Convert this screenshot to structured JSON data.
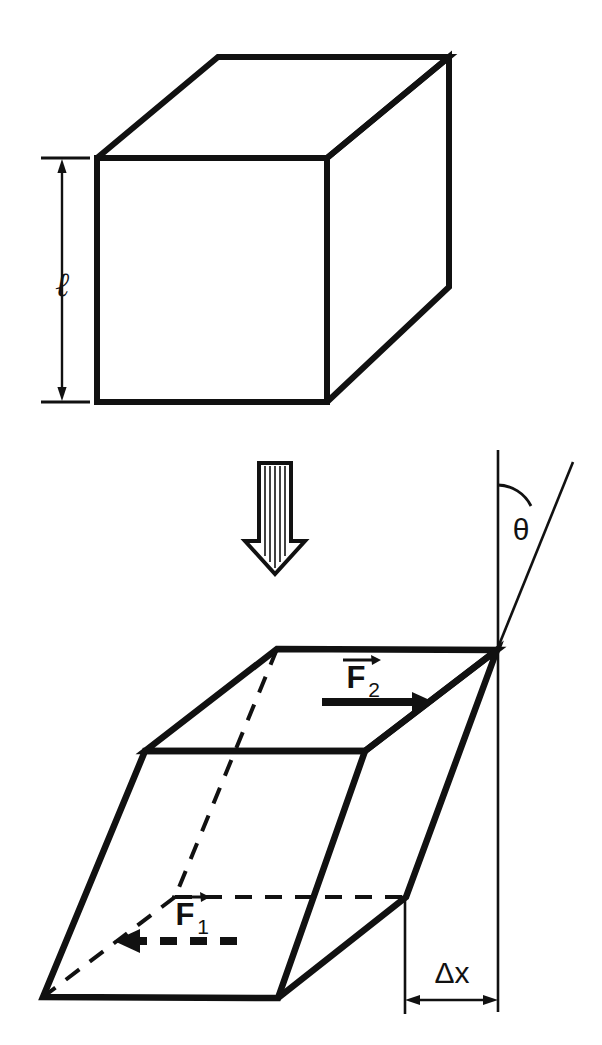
{
  "figure": {
    "background_color": "#ffffff",
    "stroke_color": "#111111",
    "width": 602,
    "height": 1045
  },
  "panels": [
    {
      "id": "undeformed",
      "name": "undeformed-cube",
      "caption": "Undeformed cube"
    },
    {
      "id": "deformed",
      "name": "sheared-cube",
      "caption": "Sheared cube"
    }
  ],
  "labels": {
    "length": "ℓ",
    "length_meaning": "side length of cube",
    "theta": "θ",
    "theta_meaning": "shear angle from vertical",
    "force_top": "F",
    "force_top_sub": "2",
    "force_bottom": "F",
    "force_bottom_sub": "1",
    "delta_x": "Δx",
    "delta_x_meaning": "shear displacement"
  },
  "icons": {
    "transform_arrow": "down-block-arrow-icon",
    "force_top_arrow": "right-solid-arrow-icon",
    "force_bottom_arrow": "left-dashed-arrow-icon",
    "length_dimension_arrow": "vertical-double-arrow-icon",
    "delta_x_dimension_arrow": "horizontal-double-arrow-icon",
    "angle_arc": "angle-arc-icon"
  },
  "geometry": {
    "cube": {
      "front_top_left": [
        97,
        158
      ],
      "front_top_right": [
        327,
        158
      ],
      "front_bottom_left": [
        97,
        402
      ],
      "front_bottom_right": [
        327,
        402
      ],
      "back_top_left": [
        218,
        57
      ],
      "back_top_right": [
        449,
        57
      ],
      "back_bottom_right": [
        449,
        287
      ]
    },
    "sheared": {
      "top_front_left": [
        145,
        751
      ],
      "top_front_right": [
        497,
        650
      ],
      "top_back_left": [
        277,
        649
      ],
      "bottom_front_left": [
        43,
        997
      ],
      "bottom_front_right": [
        278,
        998
      ],
      "bottom_back_left": [
        175,
        897
      ],
      "bottom_back_right": [
        406,
        897
      ]
    },
    "delta_x_extent": [
      405,
      498
    ],
    "length_dimension_y": [
      160,
      400
    ]
  }
}
